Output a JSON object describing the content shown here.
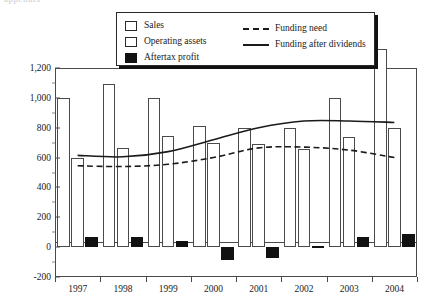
{
  "top_clipped_text": "appendix",
  "chart_data": {
    "type": "bar",
    "title": "",
    "subtitle": "",
    "xlabel": "",
    "ylabel": "",
    "ylim": [
      -200,
      1200
    ],
    "ytick_values": [
      1200,
      1000,
      800,
      600,
      400,
      200,
      0,
      -200
    ],
    "ytick_labels": [
      "1,200",
      "1,000",
      "800",
      "600",
      "400",
      "200",
      "0",
      "-200"
    ],
    "grid": false,
    "legend_position": "top-center",
    "categories": [
      "1997",
      "1998",
      "1999",
      "2000",
      "2001",
      "2002",
      "2003",
      "2004"
    ],
    "series": [
      {
        "name": "Sales",
        "kind": "bar",
        "fill": "#ffffff",
        "stroke": "#4a4a4a",
        "values": [
          1000,
          1090,
          1000,
          810,
          800,
          800,
          1000,
          1330
        ]
      },
      {
        "name": "Operating assets",
        "kind": "bar",
        "fill": "#ffffff",
        "stroke": "#4a4a4a",
        "values": [
          600,
          665,
          745,
          700,
          690,
          660,
          735,
          800
        ]
      },
      {
        "name": "Aftertax profit",
        "kind": "bar",
        "fill": "#111111",
        "stroke": "#111111",
        "values": [
          65,
          70,
          40,
          -85,
          -75,
          8,
          65,
          85
        ]
      },
      {
        "name": "Funding need",
        "kind": "line",
        "style": "dashed",
        "stroke": "#1a1a1a",
        "values": [
          545,
          540,
          555,
          600,
          665,
          670,
          650,
          600
        ]
      },
      {
        "name": "Funding after dividends",
        "kind": "line",
        "style": "solid",
        "stroke": "#1a1a1a",
        "values": [
          615,
          605,
          640,
          720,
          800,
          845,
          845,
          835
        ]
      }
    ]
  },
  "legend": {
    "bar_entries": [
      {
        "label": "Sales",
        "swatch": "open-square"
      },
      {
        "label": "Operating assets",
        "swatch": "open-square"
      },
      {
        "label": "Aftertax profit",
        "swatch": "filled-square"
      }
    ],
    "line_entries": [
      {
        "label": "Funding need",
        "style": "dashed"
      },
      {
        "label": "Funding after dividends",
        "style": "solid"
      }
    ]
  }
}
